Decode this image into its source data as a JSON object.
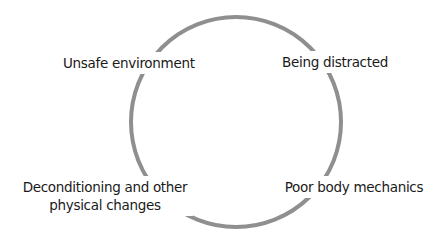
{
  "diagram": {
    "type": "cycle",
    "ring": {
      "center_x": 236,
      "center_y": 122,
      "radius": 105,
      "stroke_color": "#8f8f8f",
      "stroke_width": 4
    },
    "labels": {
      "top_left": {
        "lines": [
          "Unsafe environment"
        ]
      },
      "top_right": {
        "lines": [
          "Being distracted"
        ]
      },
      "bottom_left": {
        "lines": [
          "Deconditioning and other",
          "physical changes"
        ]
      },
      "bottom_right": {
        "lines": [
          "Poor body mechanics"
        ]
      }
    },
    "text_color": "#1a1a1a",
    "background_color": "#ffffff"
  }
}
